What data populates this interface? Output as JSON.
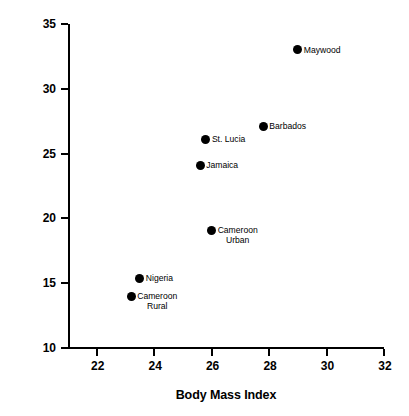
{
  "chart_data": {
    "type": "scatter",
    "title": "",
    "xlabel": "Body Mass Index",
    "ylabel": "Percent Hypertensives",
    "xlim": [
      21,
      32
    ],
    "ylim": [
      10,
      35
    ],
    "xticks": [
      22,
      24,
      26,
      28,
      30,
      32
    ],
    "yticks": [
      10,
      15,
      20,
      25,
      30,
      35
    ],
    "grid": false,
    "legend": "none",
    "marker": "filled-circle",
    "marker_color": "#000000",
    "points": [
      {
        "label": "Maywood",
        "x": 29.0,
        "y": 33.0,
        "label_pos": "right"
      },
      {
        "label": "Barbados",
        "x": 27.8,
        "y": 27.1,
        "label_pos": "right"
      },
      {
        "label": "St. Lucia",
        "x": 25.8,
        "y": 26.1,
        "label_pos": "right"
      },
      {
        "label": "Jamaica",
        "x": 25.6,
        "y": 24.1,
        "label_pos": "right"
      },
      {
        "label": "Cameroon\nUrban",
        "x": 26.0,
        "y": 19.1,
        "label_pos": "right"
      },
      {
        "label": "Nigeria",
        "x": 23.5,
        "y": 15.4,
        "label_pos": "right"
      },
      {
        "label": "Cameroon\nRural",
        "x": 23.2,
        "y": 14.0,
        "label_pos": "right"
      }
    ]
  },
  "axes": {
    "x_tick_labels": [
      "22",
      "24",
      "26",
      "28",
      "30",
      "32"
    ],
    "y_tick_labels": [
      "10",
      "15",
      "20",
      "25",
      "30",
      "35"
    ],
    "x_title": "Body Mass Index",
    "y_title": "Percent Hypertensives"
  },
  "point_labels": {
    "maywood": "Maywood",
    "barbados": "Barbados",
    "st_lucia": "St. Lucia",
    "jamaica": "Jamaica",
    "cameroon_urban_line1": "Cameroon",
    "cameroon_urban_line2": "Urban",
    "nigeria": "Nigeria",
    "cameroon_rural_line1": "Cameroon",
    "cameroon_rural_line2": "Rural"
  }
}
